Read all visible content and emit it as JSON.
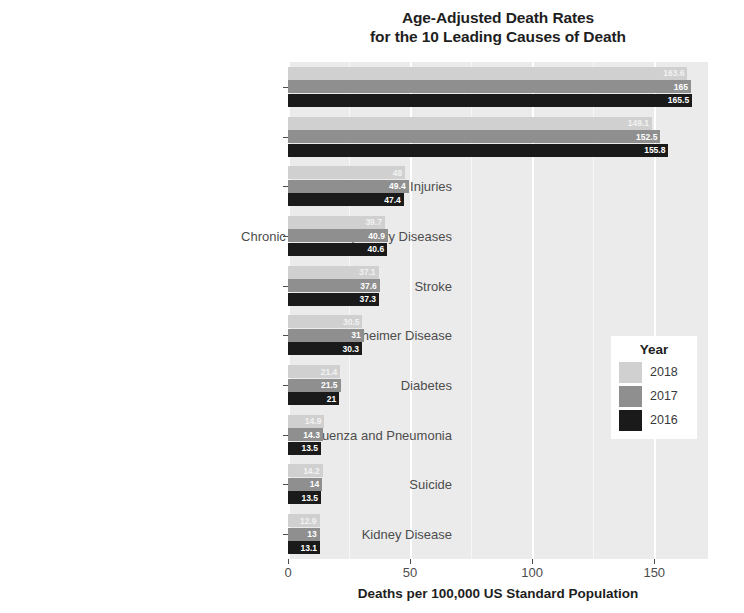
{
  "chart_data": {
    "type": "bar",
    "orientation": "horizontal",
    "title": "Age-Adjusted Death Rates for the 10 Leading Causes of Death",
    "title_line1": "Age-Adjusted Death Rates",
    "title_line2": "for the 10 Leading Causes of Death",
    "xlabel": "Deaths per 100,000 US  Standard Population",
    "ylabel": "",
    "xlim": [
      0,
      172
    ],
    "xticks": [
      0,
      50,
      100,
      150
    ],
    "xticklabels": [
      "0",
      "50",
      "100",
      "150"
    ],
    "grid": true,
    "legend_position": "inside-right",
    "legend_title": "Year",
    "categories": [
      "Heart Disease",
      "Cancer",
      "Unintentional Injuries",
      "Chronic Lower Respiratory Diseases",
      "Stroke",
      "Alzheimer Disease",
      "Diabetes",
      "Influenza and Pneumonia",
      "Suicide",
      "Kidney Disease"
    ],
    "series": [
      {
        "name": "2018",
        "color": "#d0d0d0",
        "values": [
          163.6,
          149.1,
          48.0,
          39.7,
          37.1,
          30.5,
          21.4,
          14.9,
          14.2,
          12.9
        ],
        "labels": [
          "163.6",
          "149.1",
          "48",
          "39.7",
          "37.1",
          "30.5",
          "21.4",
          "14.9",
          "14.2",
          "12.9"
        ]
      },
      {
        "name": "2017",
        "color": "#8f8f8f",
        "values": [
          165.0,
          152.5,
          49.4,
          40.9,
          37.6,
          31.0,
          21.5,
          14.3,
          14.0,
          13.0
        ],
        "labels": [
          "165",
          "152.5",
          "49.4",
          "40.9",
          "37.6",
          "31",
          "21.5",
          "14.3",
          "14",
          "13"
        ]
      },
      {
        "name": "2016",
        "color": "#1a1a1a",
        "values": [
          165.5,
          155.8,
          47.4,
          40.6,
          37.3,
          30.3,
          21.0,
          13.5,
          13.5,
          13.1
        ],
        "labels": [
          "165.5",
          "155.8",
          "47.4",
          "40.6",
          "37.3",
          "30.3",
          "21",
          "13.5",
          "13.5",
          "13.1"
        ]
      }
    ]
  }
}
